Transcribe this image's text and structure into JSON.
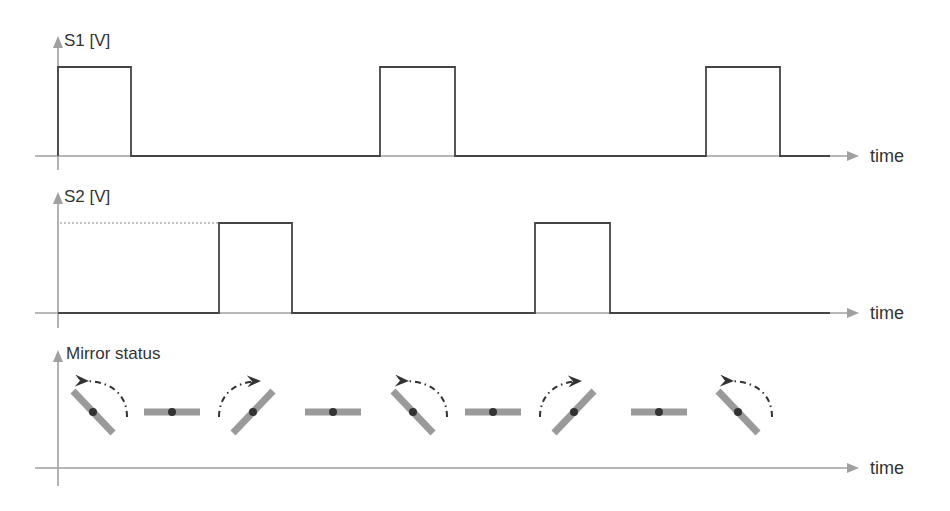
{
  "diagram": {
    "type": "timing-diagram",
    "colors": {
      "axis": "#a0a0a0",
      "signal": "#444444",
      "mirror": "#9a9a9a",
      "pivot": "#333333",
      "text": "#333333"
    },
    "panels": [
      {
        "id": "s1",
        "ylabel": "S1 [V]",
        "xlabel": "time",
        "pulses": [
          [
            58,
            131
          ],
          [
            380,
            455
          ],
          [
            706,
            780
          ]
        ]
      },
      {
        "id": "s2",
        "ylabel": "S2 [V]",
        "xlabel": "time",
        "pulses": [
          [
            219,
            292
          ],
          [
            535,
            610
          ]
        ],
        "reference_line": "dotted level line at pulse height"
      },
      {
        "id": "mirror",
        "ylabel": "Mirror status",
        "xlabel": "time",
        "states": [
          {
            "x": 93,
            "orientation": "tilted-left",
            "rotation": "counter-clockwise"
          },
          {
            "x": 172,
            "orientation": "flat"
          },
          {
            "x": 253,
            "orientation": "tilted-right",
            "rotation": "clockwise"
          },
          {
            "x": 333,
            "orientation": "flat"
          },
          {
            "x": 413,
            "orientation": "tilted-left",
            "rotation": "counter-clockwise"
          },
          {
            "x": 493,
            "orientation": "flat"
          },
          {
            "x": 574,
            "orientation": "tilted-right",
            "rotation": "clockwise"
          },
          {
            "x": 659,
            "orientation": "flat"
          },
          {
            "x": 738,
            "orientation": "tilted-left",
            "rotation": "counter-clockwise"
          }
        ]
      }
    ]
  },
  "labels": {
    "s1": "S1 [V]",
    "s2": "S2 [V]",
    "mirror": "Mirror status",
    "time": "time"
  }
}
